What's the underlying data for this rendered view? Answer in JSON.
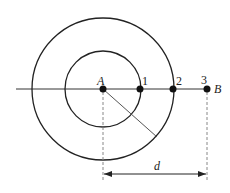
{
  "diagram": {
    "center": {
      "label": "A",
      "x": 103,
      "y": 89
    },
    "circles": [
      {
        "name": "inner-circle",
        "r": 38
      },
      {
        "name": "outer-circle",
        "r": 71
      }
    ],
    "points": [
      {
        "label": "1",
        "x": 140,
        "y": 89
      },
      {
        "label": "2",
        "x": 173,
        "y": 89
      },
      {
        "label": "3",
        "x": 207,
        "y": 89
      }
    ],
    "end_label": "B",
    "dimension": {
      "label": "d",
      "from": "A",
      "to": "3"
    },
    "colors": {
      "line": "#222222",
      "thin_line": "#555555",
      "dash": "#888888"
    }
  }
}
